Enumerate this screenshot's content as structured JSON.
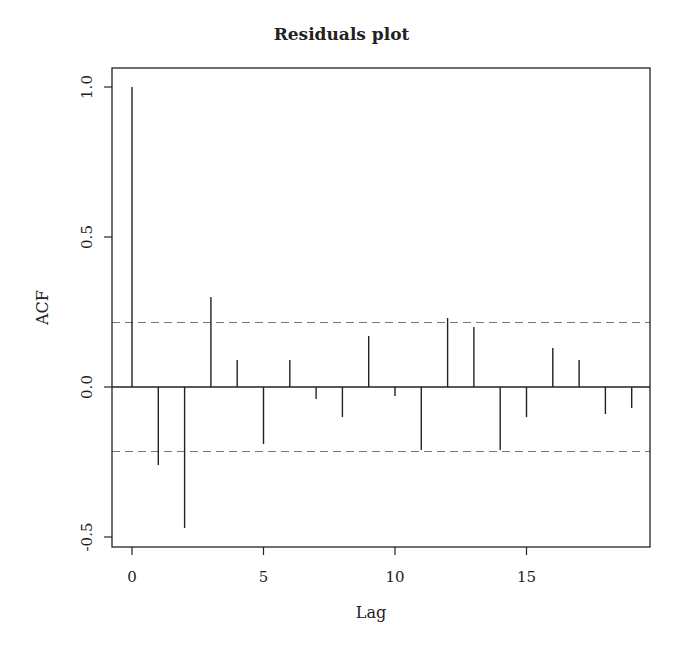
{
  "chart_data": {
    "type": "bar",
    "subtype": "acf-stem",
    "title": "Residuals plot",
    "xlabel": "Lag",
    "ylabel": "ACF",
    "x": [
      0,
      1,
      2,
      3,
      4,
      5,
      6,
      7,
      8,
      9,
      10,
      11,
      12,
      13,
      14,
      15,
      16,
      17,
      18,
      19
    ],
    "values": [
      1.0,
      -0.26,
      -0.47,
      0.3,
      0.09,
      -0.19,
      0.09,
      -0.04,
      -0.1,
      0.17,
      -0.03,
      -0.21,
      0.23,
      0.2,
      -0.21,
      -0.1,
      0.13,
      0.09,
      -0.09,
      -0.07
    ],
    "confidence_band": {
      "upper": 0.215,
      "lower": -0.215,
      "style": "dashed"
    },
    "xlim": [
      -0.75,
      19.75
    ],
    "ylim": [
      -0.55,
      1.06
    ],
    "x_ticks": [
      0,
      5,
      10,
      15
    ],
    "x_tick_labels": [
      "0",
      "5",
      "10",
      "15"
    ],
    "y_ticks": [
      -0.5,
      0.0,
      0.5,
      1.0
    ],
    "y_tick_labels": [
      "-0.5",
      "0.0",
      "0.5",
      "1.0"
    ],
    "grid": false,
    "legend": null
  },
  "colors": {
    "stem": "#222222",
    "axis": "#222222",
    "ci": "#777777"
  }
}
